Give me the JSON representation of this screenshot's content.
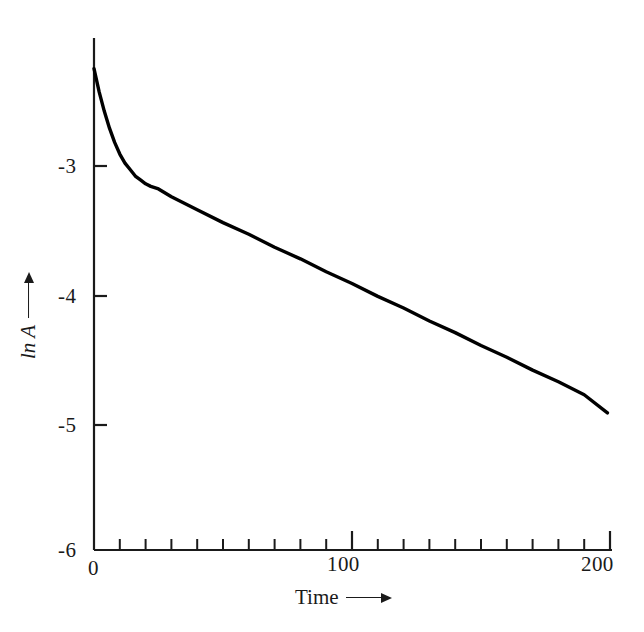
{
  "chart_data": {
    "type": "line",
    "title": "",
    "subtitle": "",
    "xlabel": "Time",
    "ylabel": "ln A",
    "xlim": [
      0,
      200
    ],
    "ylim": [
      -6,
      -2
    ],
    "grid": false,
    "legend": null,
    "x_ticks": [
      0,
      100,
      200
    ],
    "x_tick_labels": [
      "0",
      "100",
      "200"
    ],
    "x_minor_tick_step": 10,
    "y_ticks": [
      -6,
      -5,
      -4,
      -3
    ],
    "y_tick_labels": [
      "-6",
      "-5",
      "-4",
      "-3"
    ],
    "line_color": "#000000",
    "line_width": 3,
    "series": [
      {
        "name": "ln A",
        "x": [
          0,
          2,
          4,
          6,
          8,
          10,
          12,
          14,
          16,
          18,
          20,
          22,
          25,
          30,
          35,
          40,
          50,
          60,
          70,
          80,
          90,
          100,
          110,
          120,
          130,
          140,
          150,
          160,
          170,
          180,
          190,
          199
        ],
        "y": [
          -2.28,
          -2.46,
          -2.61,
          -2.74,
          -2.85,
          -2.94,
          -3.01,
          -3.06,
          -3.11,
          -3.14,
          -3.17,
          -3.19,
          -3.21,
          -3.27,
          -3.32,
          -3.37,
          -3.47,
          -3.56,
          -3.66,
          -3.75,
          -3.85,
          -3.94,
          -4.04,
          -4.13,
          -4.23,
          -4.32,
          -4.42,
          -4.51,
          -4.61,
          -4.7,
          -4.8,
          -4.94
        ]
      }
    ],
    "annotations": []
  },
  "axes": {
    "x_title": "Time",
    "y_title": "ln A",
    "x_arrow": "arrow-right-icon",
    "y_arrow": "arrow-up-icon"
  }
}
